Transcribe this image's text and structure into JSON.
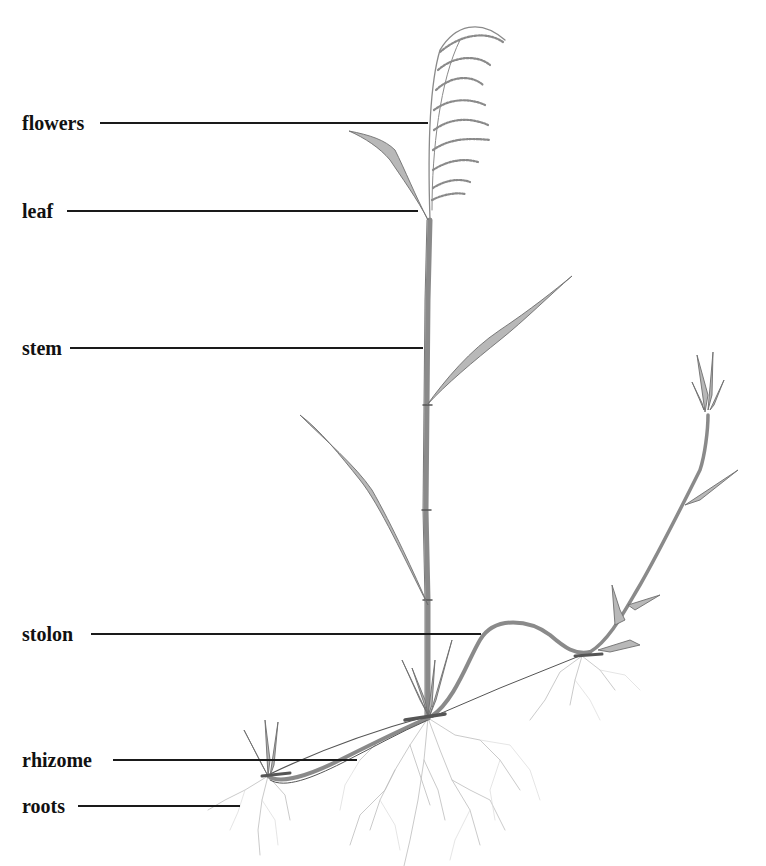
{
  "diagram": {
    "title_cutoff": "",
    "labels": [
      {
        "id": "flowers",
        "text": "flowers",
        "x": 22,
        "y": 113,
        "line_x1": 100,
        "line_x2": 428,
        "line_y": 123
      },
      {
        "id": "leaf",
        "text": "leaf",
        "x": 22,
        "y": 201,
        "line_x1": 67,
        "line_x2": 418,
        "line_y": 211
      },
      {
        "id": "stem",
        "text": "stem",
        "x": 22,
        "y": 338,
        "line_x1": 70,
        "line_x2": 423,
        "line_y": 348
      },
      {
        "id": "stolon",
        "text": "stolon",
        "x": 22,
        "y": 624,
        "line_x1": 91,
        "line_x2": 481,
        "line_y": 634
      },
      {
        "id": "rhizome",
        "text": "rhizome",
        "x": 22,
        "y": 750,
        "line_x1": 113,
        "line_x2": 357,
        "line_y": 760
      },
      {
        "id": "roots",
        "text": "roots",
        "x": 22,
        "y": 796,
        "line_x1": 78,
        "line_x2": 240,
        "line_y": 806
      }
    ],
    "colors": {
      "background": "#ffffff",
      "label_text": "#111111",
      "leader_line": "#1a1a1a",
      "pencil": "#8a8a8a"
    }
  }
}
